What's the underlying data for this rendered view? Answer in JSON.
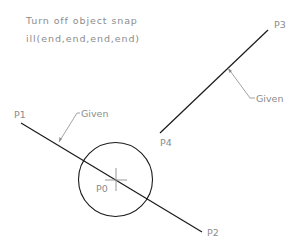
{
  "instructions": {
    "line1": "Turn off object snap",
    "line2": "ill(end,end,end,end)"
  },
  "points": {
    "p0": "P0",
    "p1": "P1",
    "p2": "P2",
    "p3": "P3",
    "p4": "P4"
  },
  "annotations": {
    "given_left": "Given",
    "given_right": "Given"
  },
  "colors": {
    "geometry": "#1a1a1a",
    "leader": "#8c8c8c",
    "text": "#8c8c8c"
  }
}
